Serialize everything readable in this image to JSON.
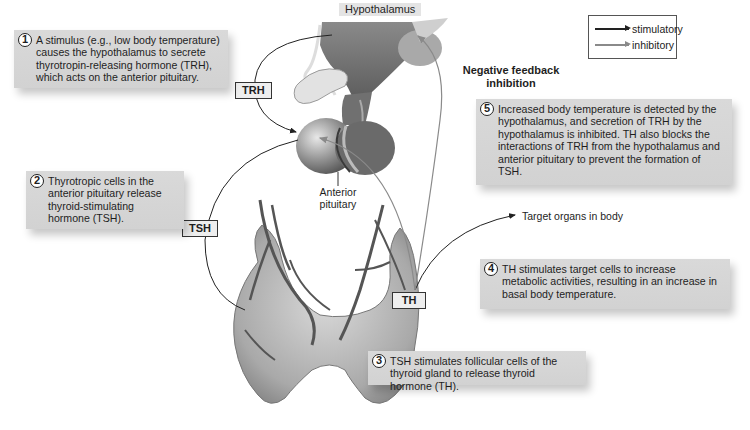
{
  "diagram": {
    "structures": {
      "hypothalamus": "Hypothalamus",
      "anterior_pituitary_line1": "Anterior",
      "anterior_pituitary_line2": "pituitary",
      "target_organs": "Target organs in body"
    },
    "hormones": {
      "trh": "TRH",
      "tsh": "TSH",
      "th": "TH"
    },
    "feedback_label_line1": "Negative feedback",
    "feedback_label_line2": "inhibition",
    "legend": {
      "items": [
        {
          "label": "stimulatory",
          "color": "#222222"
        },
        {
          "label": "inhibitory",
          "color": "#8a8a8a"
        }
      ]
    },
    "steps": [
      {
        "num": "1",
        "text": "A stimulus (e.g., low body temperature) causes the hypothalamus to secrete thyrotropin-releasing hormone (TRH), which acts on the anterior pituitary."
      },
      {
        "num": "2",
        "text": "Thyrotropic cells in the anterior pituitary release thyroid-stimulating hormone (TSH)."
      },
      {
        "num": "3",
        "text": "TSH stimulates follicular cells of the thyroid gland to release thyroid hormone (TH)."
      },
      {
        "num": "4",
        "text": "TH stimulates target cells to increase metabolic activities, resulting in an increase in basal body temperature."
      },
      {
        "num": "5",
        "text": "Increased body temperature is detected by the hypothalamus, and secretion of TRH by the hypothalamus is inhibited. TH also blocks the interactions of TRH from the hypothalamus and anterior pituitary to prevent the formation of TSH."
      }
    ],
    "colors": {
      "stimulatory": "#222222",
      "inhibitory": "#8a8a8a",
      "callout_bg": "#d6d6d6",
      "tag_bg": "#eeeeee"
    }
  }
}
